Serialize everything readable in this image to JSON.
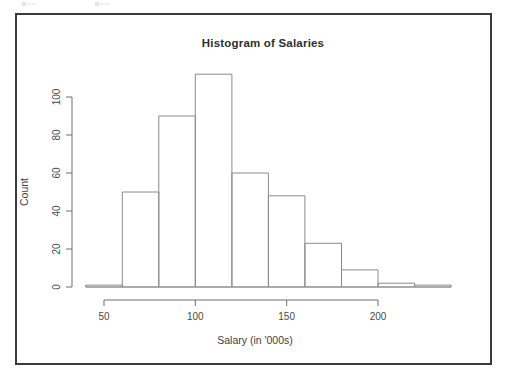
{
  "figure": {
    "title": "Histogram of Salaries",
    "xlabel": "Salary (in '000s)",
    "ylabel": "Count"
  },
  "axes": {
    "x_ticks": [
      "50",
      "100",
      "150",
      "200"
    ],
    "y_ticks": [
      "0",
      "20",
      "40",
      "60",
      "80",
      "100"
    ]
  },
  "chart_data": {
    "type": "bar",
    "title": "Histogram of Salaries",
    "xlabel": "Salary (in '000s)",
    "ylabel": "Count",
    "bin_width": 20,
    "bin_edges": [
      40,
      60,
      80,
      100,
      120,
      140,
      160,
      180,
      200,
      220,
      240
    ],
    "categories": [
      "40-60",
      "60-80",
      "80-100",
      "100-120",
      "120-140",
      "140-160",
      "160-180",
      "180-200",
      "200-220",
      "220-240"
    ],
    "values": [
      1,
      50,
      90,
      112,
      60,
      48,
      23,
      9,
      2,
      1
    ],
    "xlim": [
      40,
      240
    ],
    "ylim": [
      0,
      112
    ],
    "x_tick_values": [
      50,
      100,
      150,
      200
    ],
    "y_tick_values": [
      0,
      20,
      40,
      60,
      80,
      100
    ],
    "grid": false,
    "legend": false
  }
}
